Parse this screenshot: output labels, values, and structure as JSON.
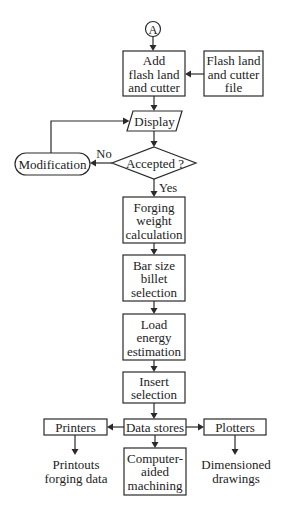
{
  "connector": {
    "label": "A"
  },
  "nodes": {
    "add_flash": {
      "lines": [
        "Add",
        "flash land",
        "and cutter"
      ]
    },
    "flash_file": {
      "lines": [
        "Flash land",
        "and cutter",
        "file"
      ]
    },
    "display": {
      "lines": [
        "Display"
      ]
    },
    "decision": {
      "lines": [
        "Accepted ?"
      ]
    },
    "modification": {
      "lines": [
        "Modification"
      ]
    },
    "forging": {
      "lines": [
        "Forging",
        "weight",
        "calculation"
      ]
    },
    "bar_size": {
      "lines": [
        "Bar size",
        "billet",
        "selection"
      ]
    },
    "load_energy": {
      "lines": [
        "Load",
        "energy",
        "estimation"
      ]
    },
    "insert": {
      "lines": [
        "Insert",
        "selection"
      ]
    },
    "data_stores": {
      "lines": [
        "Data stores"
      ]
    },
    "printers": {
      "lines": [
        "Printers"
      ]
    },
    "plotters": {
      "lines": [
        "Plotters"
      ]
    },
    "cam": {
      "lines": [
        "Computer-",
        "aided",
        "machining"
      ]
    }
  },
  "outputs": {
    "printouts": {
      "lines": [
        "Printouts",
        "forging data"
      ]
    },
    "drawings": {
      "lines": [
        "Dimensioned",
        "drawings"
      ]
    }
  },
  "edge_labels": {
    "no": "No",
    "yes": "Yes"
  }
}
